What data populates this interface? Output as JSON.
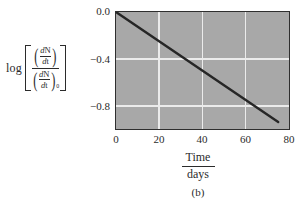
{
  "figure": {
    "caption": "(b)",
    "background_color": "#ffffff",
    "plot_background_color": "#a8a8a8",
    "gridline_color": "#ebebeb",
    "axis_color": "#2f2f2f",
    "line_color": "#262626"
  },
  "ylabel": {
    "log_text": "log",
    "numerator": {
      "d": "d",
      "N": "N",
      "dt_d": "d",
      "dt_t": "t"
    },
    "denominator": {
      "d": "d",
      "N": "N",
      "dt_d": "d",
      "dt_t": "t",
      "subscript": "0"
    }
  },
  "xlabel": {
    "numerator": "Time",
    "denominator": "days"
  },
  "axes": {
    "y_ticks": [
      "0.0",
      "−0.4",
      "−0.8"
    ],
    "x_ticks": [
      "0",
      "20",
      "40",
      "60",
      "80"
    ]
  },
  "chart_data": {
    "type": "line",
    "title": "",
    "xlabel": "Time / days",
    "ylabel": "log [ (dN/dt) / (dN/dt)₀ ]",
    "xlim": [
      0,
      80
    ],
    "ylim": [
      -1.0,
      0.0
    ],
    "xticks": [
      0,
      20,
      40,
      60,
      80
    ],
    "yticks": [
      0.0,
      -0.4,
      -0.8
    ],
    "xtick_labels": [
      "0",
      "20",
      "40",
      "60",
      "80"
    ],
    "ytick_labels": [
      "0.0",
      "−0.4",
      "−0.8"
    ],
    "grid": true,
    "grid_lines_x": [
      20,
      40,
      60
    ],
    "grid_lines_y": [
      -0.4,
      -0.8
    ],
    "legend": null,
    "series": [
      {
        "name": "log decay rate ratio",
        "x": [
          0,
          75
        ],
        "y": [
          0.0,
          -0.94
        ],
        "slope_per_day": -0.01253,
        "points": [
          {
            "x": 0,
            "y": 0.0
          },
          {
            "x": 20,
            "y": -0.25
          },
          {
            "x": 40,
            "y": -0.5
          },
          {
            "x": 60,
            "y": -0.75
          },
          {
            "x": 75,
            "y": -0.94
          }
        ]
      }
    ]
  }
}
